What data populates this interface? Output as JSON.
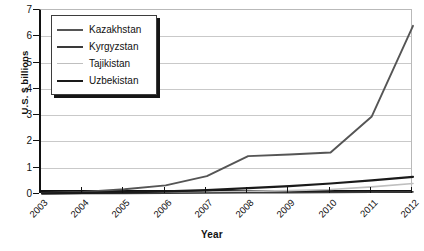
{
  "chart_data": {
    "type": "line",
    "title": "",
    "xlabel": "Year",
    "ylabel": "U.S. $ billions",
    "x": [
      2003,
      2004,
      2005,
      2006,
      2007,
      2008,
      2009,
      2010,
      2011,
      2012
    ],
    "categories": [
      "2003",
      "2004",
      "2005",
      "2006",
      "2007",
      "2008",
      "2009",
      "2010",
      "2011",
      "2012"
    ],
    "xlim": [
      2003,
      2012
    ],
    "ylim": [
      0,
      7
    ],
    "yticks": [
      0,
      1,
      2,
      3,
      4,
      5,
      6,
      7
    ],
    "ytick_labels": [
      "0",
      "1",
      "2",
      "3",
      "4",
      "5",
      "6",
      "7"
    ],
    "grid": "horizontal",
    "legend_position": "top-left",
    "series": [
      {
        "name": "Kazakhstan",
        "color": "#555555",
        "values": [
          0.04,
          0.08,
          0.18,
          0.33,
          0.68,
          1.44,
          1.5,
          1.58,
          2.95,
          6.4
        ]
      },
      {
        "name": "Kyrgyzstan",
        "color": "#3a3a3a",
        "values": [
          0.01,
          0.02,
          0.02,
          0.03,
          0.04,
          0.05,
          0.05,
          0.06,
          0.07,
          0.08
        ]
      },
      {
        "name": "Tajikistan",
        "color": "#bfbfbf",
        "values": [
          0.01,
          0.02,
          0.03,
          0.05,
          0.07,
          0.1,
          0.13,
          0.17,
          0.27,
          0.4
        ]
      },
      {
        "name": "Uzbekistan",
        "color": "#1a1a1a",
        "values": [
          0.02,
          0.04,
          0.06,
          0.1,
          0.15,
          0.22,
          0.3,
          0.4,
          0.52,
          0.65
        ]
      }
    ]
  },
  "legend": {
    "items": [
      {
        "label": "Kazakhstan"
      },
      {
        "label": "Kyrgyzstan"
      },
      {
        "label": "Tajikistan"
      },
      {
        "label": "Uzbekistan"
      }
    ]
  }
}
